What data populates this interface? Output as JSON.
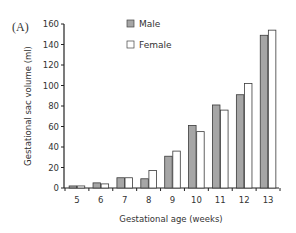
{
  "panel_label": "(A)",
  "chart_data": {
    "type": "bar",
    "title": "",
    "xlabel": "Gestational age (weeks)",
    "ylabel": "Gestational sac volume (ml)",
    "categories": [
      "5",
      "6",
      "7",
      "8",
      "9",
      "10",
      "11",
      "12",
      "13"
    ],
    "series": [
      {
        "name": "Male",
        "color": "#a6a6a6",
        "values": [
          2,
          5,
          10,
          9,
          31,
          61,
          81,
          91,
          149
        ]
      },
      {
        "name": "Female",
        "color": "#ffffff",
        "values": [
          2,
          4,
          10,
          17,
          36,
          55,
          76,
          102,
          154
        ]
      }
    ],
    "ylim": [
      0,
      160
    ],
    "yticks": [
      0,
      20,
      40,
      60,
      80,
      100,
      120,
      140,
      160
    ],
    "grid": false,
    "legend_position": "top-left-inside"
  },
  "legend": {
    "items": [
      {
        "label": "Male",
        "color": "#a6a6a6"
      },
      {
        "label": "Female",
        "color": "#ffffff"
      }
    ]
  }
}
